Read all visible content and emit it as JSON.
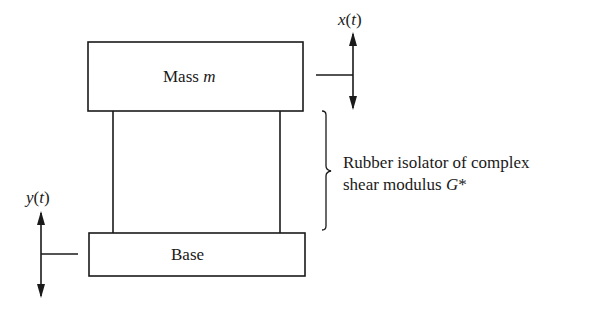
{
  "diagram": {
    "mass_label": {
      "text": "Mass ",
      "var": "m"
    },
    "base_label": "Base",
    "x_signal": {
      "var": "x",
      "arg": "t"
    },
    "y_signal": {
      "var": "y",
      "arg": "t"
    },
    "isolator_label": {
      "line1": "Rubber isolator of complex",
      "line2_text": "shear modulus ",
      "line2_var": "G",
      "line2_suffix": "*"
    },
    "colors": {
      "line": "#1a1a1a",
      "background": "#ffffff"
    }
  }
}
